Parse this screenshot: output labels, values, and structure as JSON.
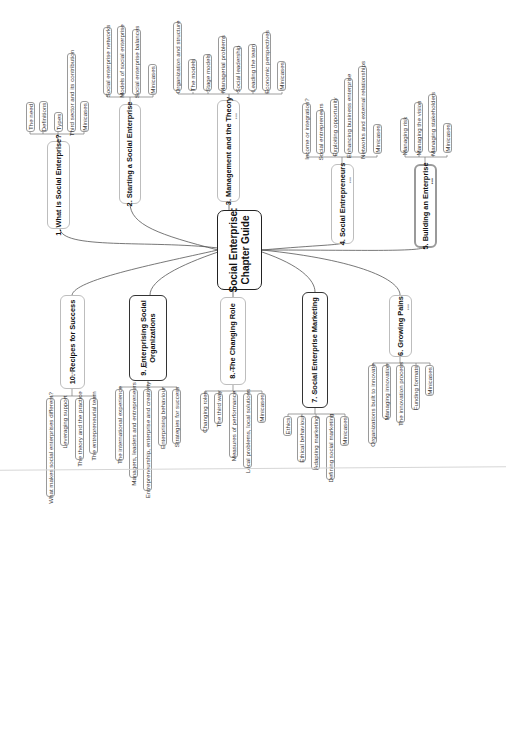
{
  "central": {
    "title_line1": "Social Enterprise:",
    "title_line2": "Chapter Guide"
  },
  "chapters": [
    {
      "id": 1,
      "title": "1. What is Social Enterprise?",
      "topics": [
        "The need",
        "Definitions",
        "Types",
        "Third sector and its contribution",
        "Minicases"
      ]
    },
    {
      "id": 2,
      "title": "2. Starting a Social Enterprise",
      "topics": [
        "Social enterprise networks",
        "Models of social enterprise",
        "Social enterprise balances",
        "Minicases"
      ]
    },
    {
      "id": 3,
      "title": "3. Management and the Theory",
      "topics": [
        "Organization and structure",
        "The models",
        "Stage models",
        "Managerial problems",
        "Social leadership",
        "Leading the team",
        "Economic perspectives",
        "Minicases"
      ]
    },
    {
      "id": 4,
      "title": "4. Social Entrepreneurs",
      "topics": [
        "Income or integration?",
        "Social entrepreneurs",
        "Exploiting opportunity",
        "Enhancing business enterprise",
        "Networks and external relationships",
        "Minicases"
      ]
    },
    {
      "id": 5,
      "title": "5. Building an Enterprise",
      "topics": [
        "Managing risk",
        "Managing the vision",
        "Managing stakeholders",
        "Minicases"
      ]
    },
    {
      "id": 6,
      "title": "6. Growing Pains",
      "topics": [
        "Organizations built to innovate",
        "Managing innovation",
        "The innovation process",
        "Funding formats",
        "Minicases"
      ]
    },
    {
      "id": 7,
      "title": "7. Social Enterprise Marketing",
      "topics": [
        "Ethics",
        "Ethical behaviour",
        "Adapting marketing",
        "Defining social marketing",
        "Minicases"
      ]
    },
    {
      "id": 8,
      "title": "8. The Changing Role",
      "topics": [
        "Changing roles",
        "The third way",
        "Measures of performance",
        "Local problems, local solutions",
        "Minicases"
      ]
    },
    {
      "id": 9,
      "title_line1": "9. Enterprising Social",
      "title_line2": "Organizations",
      "topics": [
        "The international experience",
        "Managers, leaders and entrepreneurs",
        "Entrepreneurship, enterprise and creativity",
        "Enterprising behaviour",
        "Strategies for success"
      ]
    },
    {
      "id": 10,
      "title": "10. Recipes for Success",
      "topics": [
        "What makes social enterprises different?",
        "Leveraging support",
        "The theory and the practice",
        "The entrepreneurial team"
      ]
    }
  ],
  "icons": {
    "collapse_dots": "•••"
  },
  "colors": {
    "line": "#555555",
    "box_border": "#9a9a9a",
    "central_border": "#222222"
  }
}
